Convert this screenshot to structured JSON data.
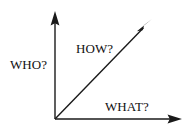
{
  "diagram": {
    "background_color": "#ffffff",
    "stroke_color": "#1a1a1a",
    "text_color": "#111111",
    "labels": {
      "vertical_axis": "WHO?",
      "diagonal_axis": "HOW?",
      "horizontal_axis": "WHAT?"
    },
    "axes": [
      {
        "name": "vertical-axis",
        "label": "WHO?",
        "direction": "up",
        "from": [
          55,
          119
        ],
        "to": [
          55,
          12
        ],
        "arrowhead": true
      },
      {
        "name": "diagonal-axis",
        "label": "HOW?",
        "direction": "up-right",
        "from": [
          55,
          119
        ],
        "to": [
          152,
          19
        ],
        "arrowhead": true
      },
      {
        "name": "horizontal-axis",
        "label": "WHAT?",
        "direction": "right",
        "from": [
          55,
          119
        ],
        "to": [
          182,
          119
        ],
        "arrowhead": true
      }
    ],
    "origin": [
      55,
      119
    ]
  }
}
